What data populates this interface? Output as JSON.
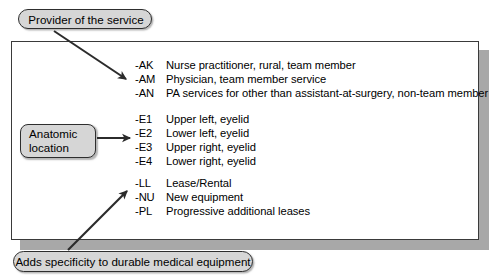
{
  "figure": {
    "background_color": "#ffffff",
    "panel_border_color": "#3a3a3a",
    "callout_fill_color": "#d6d6d6",
    "callout_border_color": "#2e2e2e",
    "arrow_color": "#2b2b2b",
    "text_color": "#000000"
  },
  "callouts": {
    "provider": {
      "label": "Provider of the service"
    },
    "anatomic": {
      "line1": "Anatomic",
      "line2": "location"
    },
    "dme": {
      "label": "Adds specificity to durable medical equipment"
    }
  },
  "modifier_groups": [
    {
      "group_name": "provider-of-service-modifiers",
      "rows": [
        {
          "code": "-AK",
          "description": "Nurse practitioner, rural, team member"
        },
        {
          "code": "-AM",
          "description": "Physician, team member service"
        },
        {
          "code": "-AN",
          "description": "PA services for other than assistant-at-surgery, non-team member"
        }
      ]
    },
    {
      "group_name": "anatomic-location-modifiers",
      "rows": [
        {
          "code": "-E1",
          "description": "Upper left, eyelid"
        },
        {
          "code": "-E2",
          "description": "Lower left, eyelid"
        },
        {
          "code": "-E3",
          "description": "Upper right, eyelid"
        },
        {
          "code": "-E4",
          "description": "Lower right, eyelid"
        }
      ]
    },
    {
      "group_name": "durable-medical-equipment-modifiers",
      "rows": [
        {
          "code": "-LL",
          "description": "Lease/Rental"
        },
        {
          "code": "-NU",
          "description": "New equipment"
        },
        {
          "code": "-PL",
          "description": "Progressive additional leases"
        }
      ]
    }
  ],
  "arrows": [
    {
      "name": "arrow-provider-to-codes",
      "direction": "down-right"
    },
    {
      "name": "arrow-anatomic-to-codes",
      "direction": "right"
    },
    {
      "name": "arrow-dme-to-codes",
      "direction": "up-right"
    }
  ]
}
